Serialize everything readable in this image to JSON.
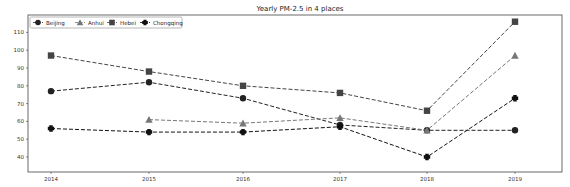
{
  "chart_data": {
    "type": "line",
    "title": "Yearly PM-2.5 in 4 places",
    "xlabel": "",
    "ylabel": "",
    "categories": [
      "2014",
      "2015",
      "2016",
      "2017",
      "2018",
      "2019"
    ],
    "ylim": [
      33,
      117
    ],
    "yticks": [
      40,
      50,
      60,
      70,
      80,
      90,
      100,
      110
    ],
    "grid": false,
    "legend_position": "upper left",
    "line_style": "dashed",
    "series": [
      {
        "name": "Beijing",
        "marker": "circle",
        "color": "#222222",
        "values": [
          77,
          82,
          73,
          58,
          55,
          55
        ]
      },
      {
        "name": "Anhui",
        "marker": "triangle",
        "color": "#777777",
        "values": [
          null,
          61,
          59,
          62,
          55,
          97
        ]
      },
      {
        "name": "Hebei",
        "marker": "square",
        "color": "#444444",
        "values": [
          97,
          88,
          80,
          76,
          66,
          116
        ]
      },
      {
        "name": "Chongqing",
        "marker": "cross",
        "color": "#111111",
        "values": [
          56,
          54,
          54,
          57,
          40,
          73
        ]
      }
    ]
  }
}
